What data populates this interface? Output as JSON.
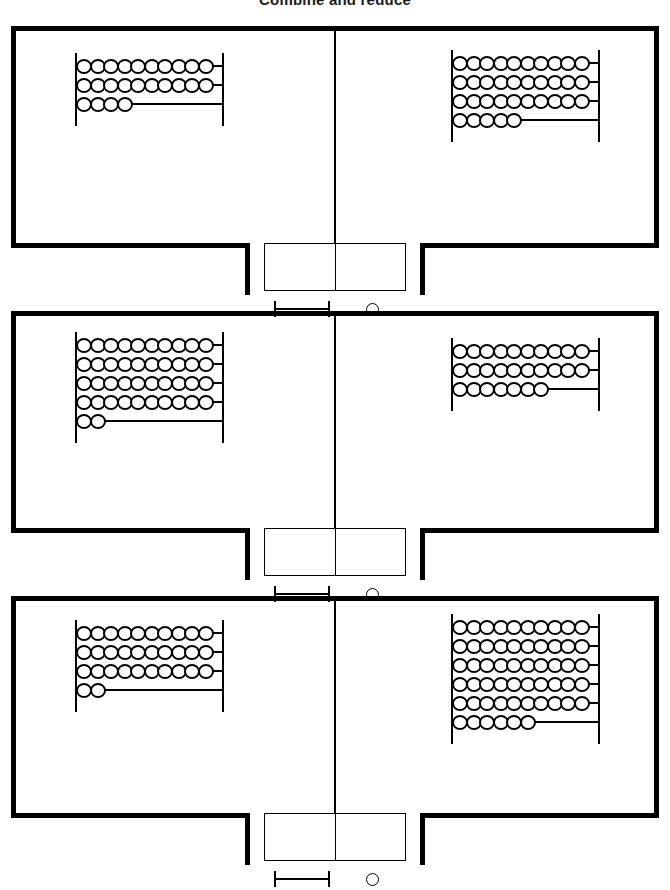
{
  "title": "Combine and reduce",
  "legend": {
    "rod_label": "ten-rod",
    "bead_label": "one-bead"
  },
  "answer_box": {
    "cells": [
      "",
      ""
    ],
    "cell_count": 2
  },
  "abacus": {
    "beads_per_full_row": 10
  },
  "problems": [
    {
      "index": 1,
      "left": {
        "rows": [
          10,
          10,
          4
        ],
        "total": 24
      },
      "right": {
        "rows": [
          10,
          10,
          10,
          5
        ],
        "total": 35
      },
      "answer": ""
    },
    {
      "index": 2,
      "left": {
        "rows": [
          10,
          10,
          10,
          10,
          2
        ],
        "total": 42
      },
      "right": {
        "rows": [
          10,
          10,
          7
        ],
        "total": 27
      },
      "answer": ""
    },
    {
      "index": 3,
      "left": {
        "rows": [
          10,
          10,
          10,
          2
        ],
        "total": 32
      },
      "right": {
        "rows": [
          10,
          10,
          10,
          10,
          10,
          6
        ],
        "total": 56
      },
      "answer": ""
    }
  ],
  "colors": {
    "ink": "#000000",
    "paper": "#ffffff"
  }
}
